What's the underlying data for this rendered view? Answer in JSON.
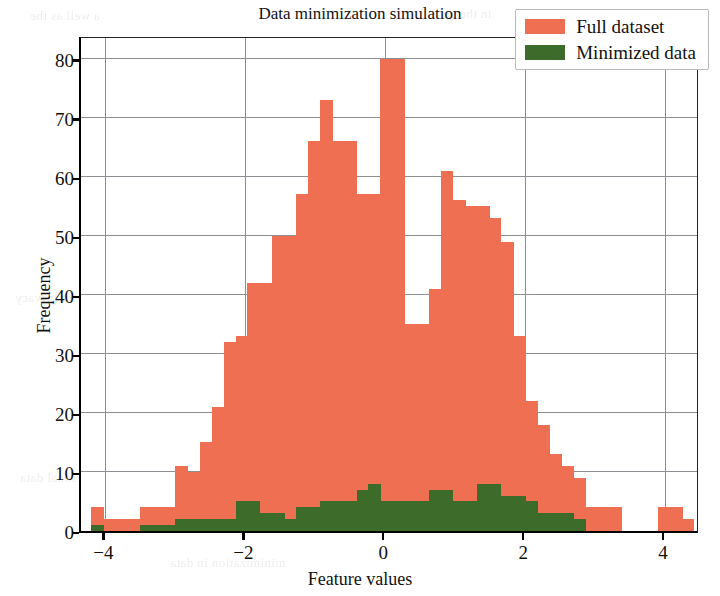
{
  "chart_data": {
    "type": "bar",
    "subtype": "histogram-overlay",
    "title": "Data minimization simulation",
    "xlabel": "Feature values",
    "ylabel": "Frequency",
    "xlim": [
      -4.35,
      4.5
    ],
    "ylim": [
      0,
      84
    ],
    "xticks": [
      -4,
      -2,
      0,
      2,
      4
    ],
    "xtick_labels": [
      "−4",
      "−2",
      "0",
      "2",
      "4"
    ],
    "yticks": [
      0,
      10,
      20,
      30,
      40,
      50,
      60,
      70,
      80
    ],
    "ytick_labels": [
      "0",
      "10",
      "20",
      "30",
      "40",
      "50",
      "60",
      "70",
      "80"
    ],
    "grid": true,
    "grid_color": "#8d8d93",
    "legend_position": "upper right",
    "bin_width": 0.1724,
    "bin_left_edges": [
      -4.2,
      -4.03,
      -3.86,
      -3.69,
      -3.51,
      -3.34,
      -3.17,
      -3.0,
      -2.83,
      -2.65,
      -2.48,
      -2.31,
      -2.14,
      -1.97,
      -1.79,
      -1.62,
      -1.45,
      -1.28,
      -1.1,
      -0.93,
      -0.76,
      -0.59,
      -0.41,
      -0.24,
      -0.07,
      0.1,
      0.28,
      0.45,
      0.62,
      0.79,
      0.97,
      1.14,
      1.31,
      1.48,
      1.66,
      1.83,
      2.0,
      2.17,
      2.34,
      2.52,
      2.69,
      2.86,
      3.03,
      3.21,
      3.38,
      3.55,
      3.72,
      3.9,
      4.07,
      4.24
    ],
    "series": [
      {
        "name": "Full dataset",
        "color": "#ef6f52",
        "values": [
          4,
          2,
          2,
          2,
          4,
          4,
          4,
          11,
          10,
          15,
          21,
          32,
          33,
          42,
          42,
          50,
          50,
          57,
          66,
          73,
          66,
          66,
          57,
          57,
          80,
          80,
          35,
          35,
          41,
          61,
          56,
          55,
          55,
          53,
          49,
          33,
          22,
          18,
          13,
          11,
          9,
          4,
          4,
          4,
          0,
          0,
          0,
          4,
          4,
          2
        ]
      },
      {
        "name": "Minimized data",
        "color": "#3d6b2a",
        "values": [
          1,
          0,
          0,
          0,
          1,
          1,
          1,
          2,
          2,
          2,
          2,
          2,
          5,
          5,
          3,
          3,
          2,
          4,
          4,
          5,
          5,
          5,
          7,
          8,
          5,
          5,
          5,
          5,
          7,
          7,
          5,
          5,
          8,
          8,
          6,
          6,
          5,
          3,
          3,
          3,
          2,
          0,
          0,
          0,
          0,
          0,
          0,
          0,
          0,
          0
        ]
      }
    ]
  },
  "legend": {
    "items": [
      {
        "label": "Full dataset",
        "color": "#ef6f52"
      },
      {
        "label": "Minimized data",
        "color": "#3d6b2a"
      }
    ]
  },
  "background_text": [
    "a well as the",
    "in the gene",
    "and the Fo",
    "a collection",
    "The same",
    "vacy of the",
    "to ensure",
    "for privacy",
    "data sets",
    "processed",
    "minimization in data",
    "of personal data"
  ]
}
